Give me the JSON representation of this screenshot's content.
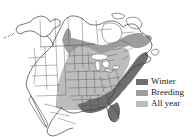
{
  "figure": {
    "type": "species-range-map",
    "region": "North America",
    "background_color": "#ffffff",
    "outline_color": "#4a4a4a",
    "coastline_color": "#3c3c3c"
  },
  "legend": {
    "position": "right",
    "items": [
      {
        "label": "Winter",
        "color": "#6e6e6e",
        "swatch_name": "winter-swatch"
      },
      {
        "label": "Breeding",
        "color": "#9d9d9d",
        "swatch_name": "breeding-swatch"
      },
      {
        "label": "All year",
        "color": "#bdbdbd",
        "swatch_name": "all-year-swatch"
      }
    ]
  },
  "map_regions": {
    "winter": {
      "label": "Winter",
      "color": "#6e6e6e",
      "description": "Southeastern United States, Gulf Coast, Florida, lower Mississippi Valley and mid-Atlantic coast"
    },
    "breeding": {
      "label": "Breeding",
      "color": "#9d9d9d",
      "description": "Northern plains, upper Midwest, Great Lakes, southern Canada and New England"
    },
    "all_year": {
      "label": "All year",
      "color": "#bdbdbd",
      "description": "Central and eastern United States overlap zone"
    },
    "unshaded": {
      "label": "Absent",
      "color": "#ffffff",
      "description": "Alaska, western Canada, Rocky Mountains, Pacific coast, Mexico and far northern Canada"
    }
  },
  "water_bodies": [
    {
      "name": "Great Lakes",
      "color": "#ffffff"
    },
    {
      "name": "Hudson Bay",
      "color": "#ffffff"
    }
  ]
}
